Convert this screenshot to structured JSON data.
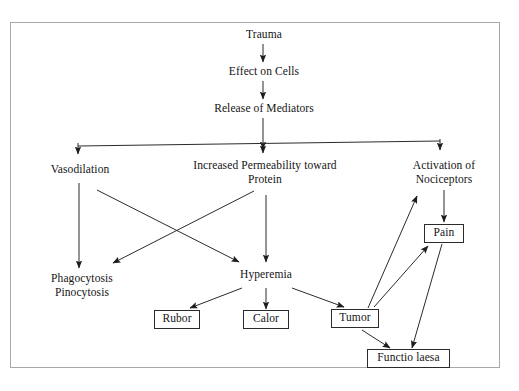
{
  "diagram": {
    "border_color": "#a8a8a8",
    "line_color": "#222222",
    "text_color": "#141414",
    "background": "#ffffff",
    "nodes": [
      {
        "id": "trauma",
        "label": "Trauma",
        "boxed": false
      },
      {
        "id": "effect",
        "label": "Effect on Cells",
        "boxed": false
      },
      {
        "id": "release",
        "label": "Release of Mediators",
        "boxed": false
      },
      {
        "id": "vasodilation",
        "label": "Vasodilation",
        "boxed": false
      },
      {
        "id": "permeability",
        "label": "Increased Permeability toward\nProtein",
        "boxed": false
      },
      {
        "id": "nociceptors",
        "label": "Activation of\nNociceptors",
        "boxed": false
      },
      {
        "id": "phagocytosis",
        "label": "Phagocytosis\nPinocytosis",
        "boxed": false
      },
      {
        "id": "hyperemia",
        "label": "Hyperemia",
        "boxed": false
      },
      {
        "id": "rubor",
        "label": "Rubor",
        "boxed": true
      },
      {
        "id": "calor",
        "label": "Calor",
        "boxed": true
      },
      {
        "id": "tumor",
        "label": "Tumor",
        "boxed": true
      },
      {
        "id": "pain",
        "label": "Pain",
        "boxed": true
      },
      {
        "id": "functiolaesa",
        "label": "Functio laesa",
        "boxed": true
      }
    ],
    "edges": [
      {
        "from": "trauma",
        "to": "effect"
      },
      {
        "from": "effect",
        "to": "release"
      },
      {
        "from": "release",
        "to": "distribution-bar"
      },
      {
        "from": "distribution-bar",
        "to": "vasodilation"
      },
      {
        "from": "distribution-bar",
        "to": "permeability"
      },
      {
        "from": "distribution-bar",
        "to": "nociceptors"
      },
      {
        "from": "vasodilation",
        "to": "phagocytosis"
      },
      {
        "from": "vasodilation",
        "to": "hyperemia"
      },
      {
        "from": "permeability",
        "to": "phagocytosis"
      },
      {
        "from": "permeability",
        "to": "hyperemia"
      },
      {
        "from": "hyperemia",
        "to": "rubor"
      },
      {
        "from": "hyperemia",
        "to": "calor"
      },
      {
        "from": "hyperemia",
        "to": "tumor"
      },
      {
        "from": "nociceptors",
        "to": "pain"
      },
      {
        "from": "tumor",
        "to": "nociceptors"
      },
      {
        "from": "tumor",
        "to": "pain"
      },
      {
        "from": "tumor",
        "to": "functiolaesa"
      },
      {
        "from": "pain",
        "to": "functiolaesa"
      }
    ]
  }
}
